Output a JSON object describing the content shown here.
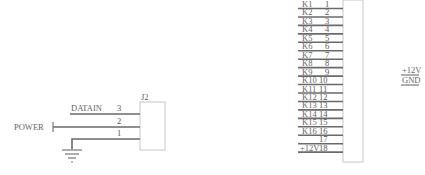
{
  "left_connector": {
    "ref": "J2",
    "pins": [
      {
        "number": "3",
        "net": "DATAIN"
      },
      {
        "number": "2",
        "net": "POWER"
      },
      {
        "number": "1",
        "net": "GND"
      }
    ],
    "power_label": "POWER",
    "datain_label": "DATAIN",
    "ground_symbol": "ground-icon"
  },
  "right_connector": {
    "rows": [
      {
        "net": "K1",
        "pin": "1"
      },
      {
        "net": "K2",
        "pin": "2"
      },
      {
        "net": "K3",
        "pin": "3"
      },
      {
        "net": "K4",
        "pin": "4"
      },
      {
        "net": "K5",
        "pin": "5"
      },
      {
        "net": "K6",
        "pin": "6"
      },
      {
        "net": "K7",
        "pin": "7"
      },
      {
        "net": "K8",
        "pin": "8"
      },
      {
        "net": "K9",
        "pin": "9"
      },
      {
        "net": "K10",
        "pin": "10"
      },
      {
        "net": "K11",
        "pin": "11"
      },
      {
        "net": "K12",
        "pin": "12"
      },
      {
        "net": "K13",
        "pin": "13"
      },
      {
        "net": "K14",
        "pin": "14"
      },
      {
        "net": "K15",
        "pin": "15"
      },
      {
        "net": "K16",
        "pin": "16"
      },
      {
        "net": "",
        "pin": "17"
      },
      {
        "net": "+12V",
        "pin": "18"
      }
    ]
  },
  "power_labels": [
    "+12V",
    "GND"
  ]
}
